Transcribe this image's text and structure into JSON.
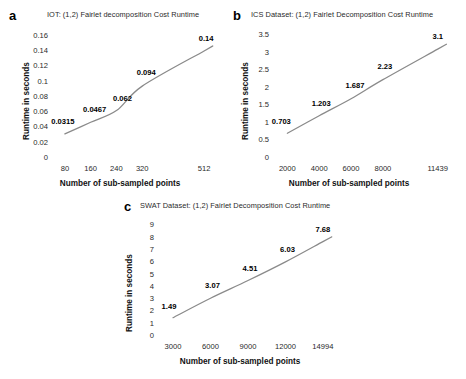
{
  "figure": {
    "xlabel_shared": "Number of sub-sampled points",
    "ylabel_shared": "Runtime in seconds",
    "line_color": "#8a8a8a",
    "label_color": "#000000"
  },
  "panels": [
    {
      "letter": "a",
      "title": "IOT: (1,2) Fairlet decomposition Cost Runtime"
    },
    {
      "letter": "b",
      "title": "ICS Dataset: (1,2) Fairlet Decomposition Cost Runtime"
    },
    {
      "letter": "c",
      "title": "SWAT Dataset: (1,2) Fairlet Decomposition Cost Runtime"
    }
  ],
  "chart_data": [
    {
      "type": "line",
      "panel": "a",
      "title": "IOT: (1,2) Fairlet decomposition Cost Runtime",
      "xlabel": "Number of sub-sampled points",
      "ylabel": "Runtime in seconds",
      "categories": [
        "80",
        "160",
        "240",
        "320",
        "512"
      ],
      "x": [
        80,
        160,
        240,
        320,
        512
      ],
      "values": [
        0.0315,
        0.0467,
        0.062,
        0.094,
        0.14
      ],
      "point_labels": [
        "0.0315",
        "0.0467",
        "0.062",
        "0.094",
        "0.14"
      ],
      "ytick_labels": [
        "0.16",
        "0.14",
        "0.12",
        "0.1",
        "0.08",
        "0.06",
        "0.04",
        "0.02",
        "0"
      ],
      "yticks": [
        0.16,
        0.14,
        0.12,
        0.1,
        0.08,
        0.06,
        0.04,
        0.02,
        0
      ],
      "ylim": [
        0,
        0.17
      ],
      "xlim": [
        40,
        552
      ],
      "grid": false,
      "legend": "none"
    },
    {
      "type": "line",
      "panel": "b",
      "title": "ICS Dataset: (1,2) Fairlet Decomposition Cost Runtime",
      "xlabel": "Number of sub-sampled points",
      "ylabel": "Runtime in seconds",
      "categories": [
        "2000",
        "4000",
        "6000",
        "8000",
        "11439"
      ],
      "x": [
        2000,
        4000,
        6000,
        8000,
        11439
      ],
      "values": [
        0.703,
        1.203,
        1.687,
        2.23,
        3.1
      ],
      "point_labels": [
        "0.703",
        "1.203",
        "1.687",
        "2.23",
        "3.1"
      ],
      "ytick_labels": [
        "3.5",
        "3",
        "2.5",
        "2",
        "1.5",
        "1",
        "0.5",
        "0"
      ],
      "yticks": [
        3.5,
        3,
        2.5,
        2,
        1.5,
        1,
        0.5,
        0
      ],
      "ylim": [
        0,
        3.7
      ],
      "xlim": [
        1100,
        12400
      ],
      "grid": false,
      "legend": "none"
    },
    {
      "type": "line",
      "panel": "c",
      "title": "SWAT Dataset: (1,2) Fairlet Decomposition Cost Runtime",
      "xlabel": "Number of sub-sampled points",
      "ylabel": "Runtime in seconds",
      "categories": [
        "3000",
        "6000",
        "9000",
        "12000",
        "14994"
      ],
      "x": [
        3000,
        6000,
        9000,
        12000,
        14994
      ],
      "values": [
        1.49,
        3.07,
        4.51,
        6.03,
        7.68
      ],
      "point_labels": [
        "1.49",
        "3.07",
        "4.51",
        "6.03",
        "7.68"
      ],
      "ytick_labels": [
        "9",
        "8",
        "7",
        "6",
        "5",
        "4",
        "3",
        "2",
        "1",
        "0"
      ],
      "yticks": [
        9,
        8,
        7,
        6,
        5,
        4,
        3,
        2,
        1,
        0
      ],
      "ylim": [
        0,
        9.6
      ],
      "xlim": [
        1800,
        16200
      ],
      "grid": false,
      "legend": "none"
    }
  ]
}
